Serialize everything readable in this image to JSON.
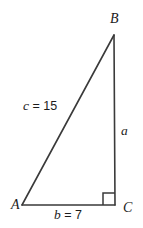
{
  "figure": {
    "type": "right-triangle-diagram",
    "background_color": "#ffffff",
    "stroke_color": "#3a3a3a",
    "text_color": "#1c1c1c",
    "width": 143,
    "height": 228,
    "vertices": [
      {
        "name": "A",
        "label": "A",
        "x": 22,
        "y": 205,
        "angle_marker": false
      },
      {
        "name": "B",
        "label": "B",
        "x": 114,
        "y": 35,
        "angle_marker": false
      },
      {
        "name": "C",
        "label": "C",
        "x": 115,
        "y": 205,
        "angle_marker": true
      }
    ],
    "right_angle": {
      "at_vertex": "C",
      "marker": "square",
      "size": 12
    },
    "sides": [
      {
        "name": "hypotenuse",
        "from": "A",
        "to": "B",
        "variable": "c",
        "separator": " = ",
        "value": "15",
        "label": "c = 15"
      },
      {
        "name": "vertical-leg",
        "from": "B",
        "to": "C",
        "variable": "a",
        "separator": "",
        "value": "",
        "label": "a"
      },
      {
        "name": "horizontal-leg",
        "from": "A",
        "to": "C",
        "variable": "b",
        "separator": " = ",
        "value": "7",
        "label": "b = 7"
      }
    ]
  }
}
